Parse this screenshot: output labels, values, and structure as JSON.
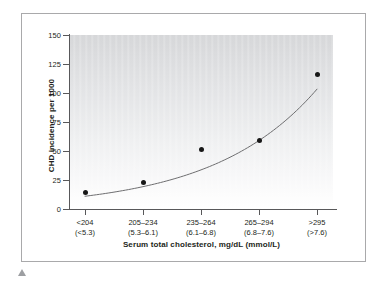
{
  "figure": {
    "border_color": "#a9a9ab",
    "background": "#ffffff",
    "caption_marker_name": "triangle-marker"
  },
  "chart_data": {
    "type": "scatter",
    "title": "",
    "subtitle": "",
    "xlabel": "Serum total cholesterol, mg/dL (mmol/L)",
    "ylabel": "CHD incidence per 1000",
    "categories": [
      "<204\n(<5.3)",
      "205–234\n(5.3–6.1)",
      "235–264\n(6.1–6.8)",
      "265–294\n(6.8–7.6)",
      ">295\n(>7.6)"
    ],
    "category_lines": [
      {
        "top": "<204",
        "bottom": "(<5.3)"
      },
      {
        "top": "205–234",
        "bottom": "(5.3–6.1)"
      },
      {
        "top": "235–264",
        "bottom": "(6.1–6.8)"
      },
      {
        "top": "265–294",
        "bottom": "(6.8–7.6)"
      },
      {
        "top": ">295",
        "bottom": "(>7.6)"
      }
    ],
    "values": [
      14,
      23,
      51,
      59,
      116
    ],
    "ylim": [
      0,
      150
    ],
    "yticks": [
      0,
      25,
      50,
      75,
      100,
      125,
      150
    ],
    "ytick_labels": [
      "0",
      "25",
      "50",
      "75",
      "100",
      "125",
      "150"
    ],
    "grid": false,
    "legend": null,
    "series": [
      {
        "name": "CHD incidence",
        "marker": "filled-circle",
        "marker_color": "#171717",
        "values": [
          14,
          23,
          51,
          59,
          116
        ]
      },
      {
        "name": "fitted trend curve",
        "type": "line",
        "line_color": "#6e6e70"
      }
    ],
    "plot_background": "gray-vertical-gradient",
    "annotations": []
  }
}
